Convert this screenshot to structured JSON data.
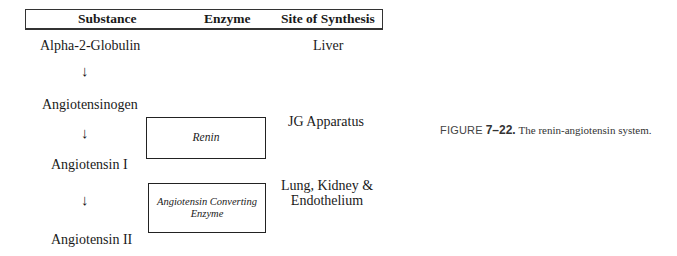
{
  "table_header": {
    "columns": [
      "Substance",
      "Enzyme",
      "Site of Synthesis"
    ]
  },
  "substances": [
    "Alpha-2-Globulin",
    "Angiotensinogen",
    "Angiotensin I",
    "Angiotensin II"
  ],
  "arrows": [
    "↓",
    "↓",
    "↓"
  ],
  "enzymes": [
    {
      "name": "Renin",
      "site": "JG Apparatus"
    },
    {
      "name_line1": "Angiotensin Converting",
      "name_line2": "Enzyme",
      "site_line1": "Lung, Kidney &",
      "site_line2": "Endothelium"
    }
  ],
  "first_site": "Liver",
  "caption": {
    "label": "FIGURE",
    "number": "7–22.",
    "text": "The renin-angiotensin system."
  }
}
